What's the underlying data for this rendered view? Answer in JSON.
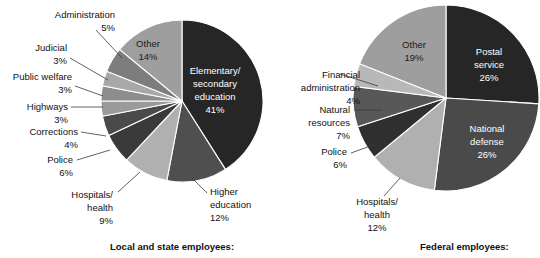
{
  "figure": {
    "background": "#ffffff",
    "leader_color": "#3a3a3a"
  },
  "chart_data": [
    {
      "type": "pie",
      "title": "Local and state employees:",
      "caption": "Local and state employees:",
      "start_angle_deg": 0,
      "direction": "clockwise",
      "center": [
        182,
        101
      ],
      "radius": 81,
      "categories": [
        "Elementary/ secondary education",
        "Higher education",
        "Hospitals/ health",
        "Police",
        "Corrections",
        "Highways",
        "Public welfare",
        "Judicial",
        "Administration",
        "Other"
      ],
      "values": [
        41,
        12,
        9,
        6,
        4,
        3,
        3,
        3,
        5,
        14
      ],
      "value_labels": [
        "41%",
        "12%",
        "9%",
        "6%",
        "4%",
        "3%",
        "3%",
        "3%",
        "5%",
        "14%"
      ],
      "colors": [
        "#262626",
        "#4f4f4f",
        "#b0b0b0",
        "#3a3a3a",
        "#4a4a4a",
        "#9a9a9a",
        "#8d8d8d",
        "#a8a8a8",
        "#7d7d7d",
        "#9e9e9e"
      ],
      "slices": [
        {
          "name": "Elementary/ secondary education",
          "value": 41,
          "value_label": "41%",
          "color": "#262626",
          "label_placement": "inside",
          "label_lines": [
            "Elementary/",
            "secondary",
            "education",
            "41%"
          ],
          "label_x": 215,
          "label_y": 74,
          "text_color": "#ffffff"
        },
        {
          "name": "Higher education",
          "value": 12,
          "value_label": "12%",
          "color": "#4f4f4f",
          "label_placement": "outside",
          "label_lines": [
            "Higher",
            "education",
            "12%"
          ],
          "label_x": 210,
          "label_y": 195,
          "text_color": "#111111",
          "anchor": "start",
          "leader": [
            [
              207,
              193
            ],
            [
              192,
              178
            ]
          ]
        },
        {
          "name": "Hospitals/ health",
          "value": 9,
          "value_label": "9%",
          "color": "#b0b0b0",
          "label_placement": "outside",
          "label_lines": [
            "Hospitals/",
            "health",
            "9%"
          ],
          "label_x": 113,
          "label_y": 198,
          "text_color": "#111111",
          "anchor": "end",
          "leader": [
            [
              118,
              192
            ],
            [
              140,
              172
            ]
          ]
        },
        {
          "name": "Police",
          "value": 6,
          "value_label": "6%",
          "color": "#3a3a3a",
          "label_placement": "outside",
          "label_lines": [
            "Police",
            "6%"
          ],
          "label_x": 73,
          "label_y": 163,
          "text_color": "#111111",
          "anchor": "end",
          "leader": [
            [
              77,
              160
            ],
            [
              110,
              150
            ]
          ]
        },
        {
          "name": "Corrections",
          "value": 4,
          "value_label": "4%",
          "color": "#4a4a4a",
          "label_placement": "outside",
          "label_lines": [
            "Corrections",
            "4%"
          ],
          "label_x": 78,
          "label_y": 135,
          "text_color": "#111111",
          "anchor": "end",
          "leader": [
            [
              81,
              132
            ],
            [
              106,
              136
            ]
          ]
        },
        {
          "name": "Highways",
          "value": 3,
          "value_label": "3%",
          "color": "#9a9a9a",
          "label_placement": "outside",
          "label_lines": [
            "Highways",
            "3%"
          ],
          "label_x": 68,
          "label_y": 110,
          "text_color": "#111111",
          "anchor": "end",
          "leader": [
            [
              71,
              107
            ],
            [
              103,
              107
            ]
          ]
        },
        {
          "name": "Public welfare",
          "value": 3,
          "value_label": "3%",
          "color": "#8d8d8d",
          "label_placement": "outside",
          "label_lines": [
            "Public welfare",
            "3%"
          ],
          "label_x": 72,
          "label_y": 80,
          "text_color": "#111111",
          "anchor": "end",
          "leader": [
            [
              75,
              86
            ],
            [
              103,
              96
            ]
          ]
        },
        {
          "name": "Judicial",
          "value": 3,
          "value_label": "3%",
          "color": "#a8a8a8",
          "label_placement": "outside",
          "label_lines": [
            "Judicial",
            "3%"
          ],
          "label_x": 67,
          "label_y": 51,
          "text_color": "#111111",
          "anchor": "end",
          "leader": [
            [
              70,
              58
            ],
            [
              108,
              80
            ]
          ]
        },
        {
          "name": "Administration",
          "value": 5,
          "value_label": "5%",
          "color": "#7d7d7d",
          "label_placement": "outside",
          "label_lines": [
            "Administration",
            "5%"
          ],
          "label_x": 115,
          "label_y": 18,
          "text_color": "#111111",
          "anchor": "end",
          "leader": [
            [
              96,
              30
            ],
            [
              122,
              58
            ]
          ]
        },
        {
          "name": "Other",
          "value": 14,
          "value_label": "14%",
          "color": "#9e9e9e",
          "label_placement": "inside",
          "label_lines": [
            "Other",
            "14%"
          ],
          "label_x": 148,
          "label_y": 47,
          "text_color": "#1a1a1a"
        }
      ]
    },
    {
      "type": "pie",
      "title": "Federal employees:",
      "caption": "Federal employees:",
      "start_angle_deg": 0,
      "direction": "clockwise",
      "center": [
        446,
        98
      ],
      "radius": 93,
      "categories": [
        "Postal service",
        "National defense",
        "Hospitals/ health",
        "Police",
        "Natural resources",
        "Financial administration",
        "Other"
      ],
      "values": [
        26,
        26,
        12,
        6,
        7,
        4,
        19
      ],
      "value_labels": [
        "26%",
        "26%",
        "12%",
        "6%",
        "7%",
        "4%",
        "19%"
      ],
      "colors": [
        "#262626",
        "#4a4a4a",
        "#b0b0b0",
        "#2f2f2f",
        "#585858",
        "#b8b8b8",
        "#9e9e9e"
      ],
      "slices": [
        {
          "name": "Postal service",
          "value": 26,
          "value_label": "26%",
          "color": "#262626",
          "label_placement": "inside",
          "label_lines": [
            "Postal",
            "service",
            "26%"
          ],
          "label_x": 489,
          "label_y": 55,
          "text_color": "#ffffff"
        },
        {
          "name": "National defense",
          "value": 26,
          "value_label": "26%",
          "color": "#4a4a4a",
          "label_placement": "inside",
          "label_lines": [
            "National",
            "defense",
            "26%"
          ],
          "label_x": 487,
          "label_y": 132,
          "text_color": "#ffffff"
        },
        {
          "name": "Hospitals/ health",
          "value": 12,
          "value_label": "12%",
          "color": "#b0b0b0",
          "label_placement": "outside",
          "label_lines": [
            "Hospitals/",
            "health",
            "12%"
          ],
          "label_x": 377,
          "label_y": 205,
          "text_color": "#111111",
          "anchor": "middle",
          "leader": [
            [
              384,
              196
            ],
            [
              400,
              178
            ]
          ]
        },
        {
          "name": "Police",
          "value": 6,
          "value_label": "6%",
          "color": "#2f2f2f",
          "label_placement": "outside",
          "label_lines": [
            "Police",
            "6%"
          ],
          "label_x": 347,
          "label_y": 155,
          "text_color": "#111111",
          "anchor": "end",
          "leader": [
            [
              351,
              153
            ],
            [
              376,
              144
            ]
          ]
        },
        {
          "name": "Natural resources",
          "value": 7,
          "value_label": "7%",
          "color": "#585858",
          "label_placement": "outside",
          "label_lines": [
            "Natural",
            "resources",
            "7%"
          ],
          "label_x": 350,
          "label_y": 113,
          "text_color": "#111111",
          "anchor": "end",
          "leader": [
            [
              354,
              110
            ],
            [
              382,
              110
            ]
          ]
        },
        {
          "name": "Financial administration",
          "value": 4,
          "value_label": "4%",
          "color": "#b8b8b8",
          "label_placement": "outside",
          "label_lines": [
            "Financial",
            "administration",
            "4%"
          ],
          "label_x": 360,
          "label_y": 78,
          "text_color": "#111111",
          "anchor": "end",
          "leader": [
            [
              340,
              74
            ],
            [
              378,
              86
            ]
          ]
        },
        {
          "name": "Other",
          "value": 19,
          "value_label": "19%",
          "color": "#9e9e9e",
          "label_placement": "inside",
          "label_lines": [
            "Other",
            "19%"
          ],
          "label_x": 414,
          "label_y": 48,
          "text_color": "#1a1a1a"
        }
      ]
    }
  ],
  "captions": {
    "left": "Local and state employees:",
    "right": "Federal employees:",
    "left_x": 110,
    "right_x": 420,
    "y": 250
  }
}
